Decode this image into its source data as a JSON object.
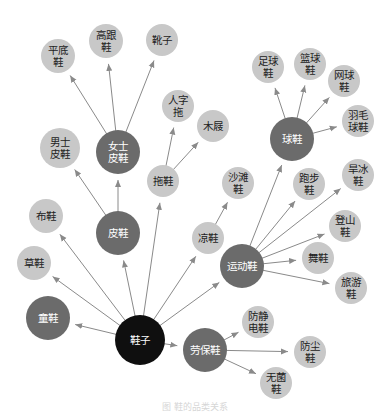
{
  "colors": {
    "root": "#0f0f0f",
    "category": "#6b6b6b",
    "leaf": "#c8c8c8",
    "edge": "#8a8a8a",
    "root_text": "#ffffff",
    "category_text": "#ffffff",
    "leaf_text": "#222222"
  },
  "nodes": [
    {
      "id": "shoes",
      "lines": [
        "鞋子"
      ],
      "type": "root",
      "x": 140,
      "y": 340,
      "r": 25
    },
    {
      "id": "kids",
      "lines": [
        "童鞋"
      ],
      "type": "category",
      "x": 48,
      "y": 318,
      "r": 22
    },
    {
      "id": "straw",
      "lines": [
        "草鞋"
      ],
      "type": "leaf",
      "x": 34,
      "y": 263,
      "r": 17
    },
    {
      "id": "cloth",
      "lines": [
        "布鞋"
      ],
      "type": "leaf",
      "x": 46,
      "y": 216,
      "r": 17
    },
    {
      "id": "leather",
      "lines": [
        "皮鞋"
      ],
      "type": "category",
      "x": 118,
      "y": 233,
      "r": 22
    },
    {
      "id": "men-leather",
      "lines": [
        "男士",
        "皮鞋"
      ],
      "type": "leaf",
      "x": 60,
      "y": 148,
      "r": 20
    },
    {
      "id": "women-leather",
      "lines": [
        "女士",
        "皮鞋"
      ],
      "type": "category",
      "x": 118,
      "y": 152,
      "r": 22
    },
    {
      "id": "flats",
      "lines": [
        "平底",
        "鞋"
      ],
      "type": "leaf",
      "x": 58,
      "y": 56,
      "r": 17
    },
    {
      "id": "heels",
      "lines": [
        "高跟",
        "鞋"
      ],
      "type": "leaf",
      "x": 106,
      "y": 41,
      "r": 17
    },
    {
      "id": "boots",
      "lines": [
        "靴子"
      ],
      "type": "leaf",
      "x": 162,
      "y": 40,
      "r": 16
    },
    {
      "id": "slippers",
      "lines": [
        "拖鞋"
      ],
      "type": "leaf",
      "x": 163,
      "y": 181,
      "r": 16
    },
    {
      "id": "flipflops",
      "lines": [
        "人字",
        "拖"
      ],
      "type": "leaf",
      "x": 178,
      "y": 106,
      "r": 16
    },
    {
      "id": "clogs",
      "lines": [
        "木屐"
      ],
      "type": "leaf",
      "x": 213,
      "y": 126,
      "r": 16
    },
    {
      "id": "beach",
      "lines": [
        "沙滩",
        "鞋"
      ],
      "type": "leaf",
      "x": 238,
      "y": 183,
      "r": 16
    },
    {
      "id": "sandals",
      "lines": [
        "凉鞋"
      ],
      "type": "leaf",
      "x": 208,
      "y": 238,
      "r": 16
    },
    {
      "id": "sports",
      "lines": [
        "运动鞋"
      ],
      "type": "category",
      "x": 242,
      "y": 266,
      "r": 22
    },
    {
      "id": "ball",
      "lines": [
        "球鞋"
      ],
      "type": "category",
      "x": 292,
      "y": 139,
      "r": 22
    },
    {
      "id": "football",
      "lines": [
        "足球",
        "鞋"
      ],
      "type": "leaf",
      "x": 268,
      "y": 67,
      "r": 16
    },
    {
      "id": "basketball",
      "lines": [
        "篮球",
        "鞋"
      ],
      "type": "leaf",
      "x": 310,
      "y": 64,
      "r": 16
    },
    {
      "id": "tennis",
      "lines": [
        "网球",
        "鞋"
      ],
      "type": "leaf",
      "x": 344,
      "y": 81,
      "r": 16
    },
    {
      "id": "badminton",
      "lines": [
        "羽毛",
        "球鞋"
      ],
      "type": "leaf",
      "x": 358,
      "y": 121,
      "r": 16
    },
    {
      "id": "running",
      "lines": [
        "跑步",
        "鞋"
      ],
      "type": "leaf",
      "x": 309,
      "y": 184,
      "r": 16
    },
    {
      "id": "skates",
      "lines": [
        "旱冰",
        "鞋"
      ],
      "type": "leaf",
      "x": 358,
      "y": 175,
      "r": 16
    },
    {
      "id": "hiking",
      "lines": [
        "登山",
        "鞋"
      ],
      "type": "leaf",
      "x": 345,
      "y": 226,
      "r": 16
    },
    {
      "id": "dance",
      "lines": [
        "舞鞋"
      ],
      "type": "leaf",
      "x": 318,
      "y": 258,
      "r": 16
    },
    {
      "id": "travel",
      "lines": [
        "旅游",
        "鞋"
      ],
      "type": "leaf",
      "x": 351,
      "y": 288,
      "r": 16
    },
    {
      "id": "safety",
      "lines": [
        "劳保鞋"
      ],
      "type": "category",
      "x": 205,
      "y": 350,
      "r": 22
    },
    {
      "id": "antistatic",
      "lines": [
        "防静",
        "电鞋"
      ],
      "type": "leaf",
      "x": 258,
      "y": 322,
      "r": 16
    },
    {
      "id": "dustproof",
      "lines": [
        "防尘",
        "鞋"
      ],
      "type": "leaf",
      "x": 310,
      "y": 352,
      "r": 16
    },
    {
      "id": "sterile",
      "lines": [
        "无菌",
        "鞋"
      ],
      "type": "leaf",
      "x": 276,
      "y": 383,
      "r": 16
    }
  ],
  "edges": [
    [
      "shoes",
      "kids"
    ],
    [
      "shoes",
      "straw"
    ],
    [
      "shoes",
      "cloth"
    ],
    [
      "shoes",
      "leather"
    ],
    [
      "shoes",
      "slippers"
    ],
    [
      "shoes",
      "sandals"
    ],
    [
      "shoes",
      "sports"
    ],
    [
      "shoes",
      "safety"
    ],
    [
      "leather",
      "men-leather"
    ],
    [
      "leather",
      "women-leather"
    ],
    [
      "women-leather",
      "flats"
    ],
    [
      "women-leather",
      "heels"
    ],
    [
      "women-leather",
      "boots"
    ],
    [
      "slippers",
      "flipflops"
    ],
    [
      "slippers",
      "clogs"
    ],
    [
      "sandals",
      "beach"
    ],
    [
      "sports",
      "ball"
    ],
    [
      "sports",
      "running"
    ],
    [
      "sports",
      "skates"
    ],
    [
      "sports",
      "hiking"
    ],
    [
      "sports",
      "dance"
    ],
    [
      "sports",
      "travel"
    ],
    [
      "ball",
      "football"
    ],
    [
      "ball",
      "basketball"
    ],
    [
      "ball",
      "tennis"
    ],
    [
      "ball",
      "badminton"
    ],
    [
      "safety",
      "antistatic"
    ],
    [
      "safety",
      "dustproof"
    ],
    [
      "safety",
      "sterile"
    ]
  ],
  "caption": "图 鞋的品类关系"
}
